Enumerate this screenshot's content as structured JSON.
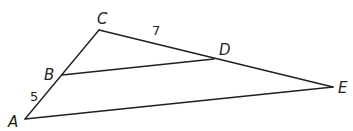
{
  "diagram": {
    "type": "geometry-triangle",
    "stroke_color": "#231f20",
    "points": {
      "A": {
        "x": 25,
        "y": 119
      },
      "B": {
        "x": 62,
        "y": 75
      },
      "C": {
        "x": 99,
        "y": 30
      },
      "D": {
        "x": 214,
        "y": 59
      },
      "E": {
        "x": 333,
        "y": 87
      }
    },
    "segments": [
      {
        "name": "CA",
        "from": "C",
        "to": "A"
      },
      {
        "name": "CE",
        "from": "C",
        "to": "E"
      },
      {
        "name": "BD",
        "from": "B",
        "to": "D"
      },
      {
        "name": "AE",
        "from": "A",
        "to": "E"
      }
    ],
    "labels": {
      "C": "C",
      "D": "D",
      "B": "B",
      "A": "A",
      "E": "E"
    },
    "measurements": {
      "CD": "7",
      "AB": "5"
    }
  }
}
